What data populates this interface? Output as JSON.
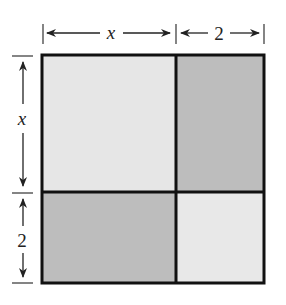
{
  "diagram": {
    "type": "area-model-square",
    "top_dimensions": [
      {
        "label": "x",
        "italic": true
      },
      {
        "label": "2",
        "italic": false
      }
    ],
    "left_dimensions": [
      {
        "label": "x",
        "italic": true
      },
      {
        "label": "2",
        "italic": false
      }
    ],
    "regions": [
      {
        "name": "x-by-x",
        "shade": "light",
        "color": "#e6e6e6"
      },
      {
        "name": "2-by-x-right",
        "shade": "dark",
        "color": "#bdbdbd"
      },
      {
        "name": "x-by-2-bottom",
        "shade": "dark",
        "color": "#bdbdbd"
      },
      {
        "name": "2-by-2",
        "shade": "light",
        "color": "#e8e8e8"
      }
    ],
    "colors": {
      "stroke": "#111111",
      "light": "#e6e6e6",
      "dark": "#bdbdbd"
    }
  }
}
